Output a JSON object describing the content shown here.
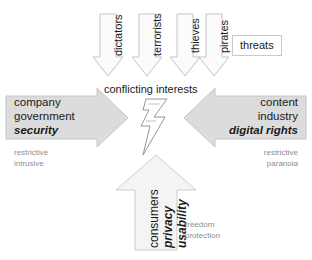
{
  "diagram": {
    "title": "conflicting interests",
    "center_icon": "lightning-bolt-icon",
    "colors": {
      "arrow_fill_solid": "#dcdcdc",
      "arrow_fill_light": "#f7f7f7",
      "arrow_stroke": "#b4b4b4",
      "text": "#1a1a1a",
      "subtext": "#8e8e8e"
    },
    "threat_arrows": [
      {
        "label": "dictators"
      },
      {
        "label": "terrorists"
      },
      {
        "label": "thieves"
      },
      {
        "label": "pirates"
      }
    ],
    "threats_group_label": "threats",
    "left_actor": {
      "line1": "company",
      "line2": "government",
      "line3": "security",
      "sub1": "restrictive",
      "sub2": "intrusive"
    },
    "right_actor": {
      "line1": "content",
      "line2": "industry",
      "line3": "digital rights",
      "sub1": "restrictive",
      "sub2": "paranoia"
    },
    "bottom_actor": {
      "line1": "consumers",
      "line2": "privacy",
      "line3": "usability",
      "sub1": "freedom",
      "sub2": "protection"
    }
  }
}
